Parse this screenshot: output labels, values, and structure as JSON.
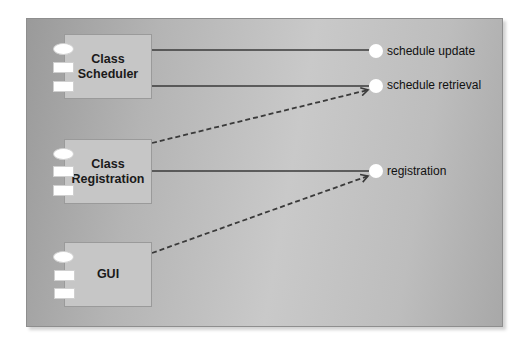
{
  "diagram": {
    "type": "UML component diagram",
    "components": [
      {
        "id": "class-scheduler",
        "label_line1": "Class",
        "label_line2": "Scheduler"
      },
      {
        "id": "class-registration",
        "label_line1": "Class",
        "label_line2": "Registration"
      },
      {
        "id": "gui",
        "label_line1": "GUI",
        "label_line2": ""
      }
    ],
    "interfaces": [
      {
        "id": "schedule-update",
        "label": "schedule update"
      },
      {
        "id": "schedule-retrieval",
        "label": "schedule retrieval"
      },
      {
        "id": "registration",
        "label": "registration"
      }
    ],
    "connections": [
      {
        "from": "Class Scheduler",
        "to": "schedule update",
        "style": "solid",
        "kind": "realization"
      },
      {
        "from": "Class Scheduler",
        "to": "schedule retrieval",
        "style": "solid",
        "kind": "realization"
      },
      {
        "from": "Class Registration",
        "to": "registration",
        "style": "solid",
        "kind": "realization"
      },
      {
        "from": "Class Registration",
        "to": "schedule retrieval",
        "style": "dashed-arrow",
        "kind": "dependency"
      },
      {
        "from": "GUI",
        "to": "registration",
        "style": "dashed-arrow",
        "kind": "dependency"
      }
    ],
    "colors": {
      "panel": "#b8b8b8",
      "component_fill": "#c6c6c6",
      "line": "#3a3a3a",
      "interface_fill": "#ffffff"
    }
  }
}
